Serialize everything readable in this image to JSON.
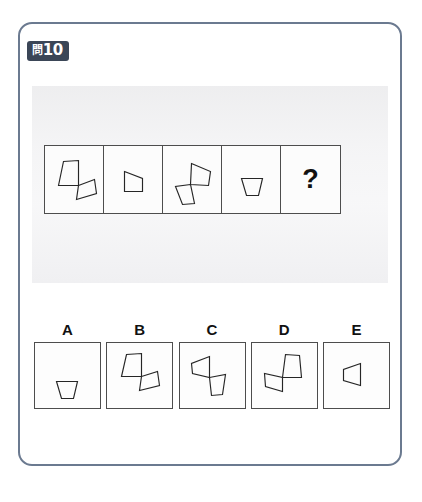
{
  "card": {
    "badge": {
      "kanji": "問",
      "number": "10",
      "full_text": "問10",
      "bg_color": "#3b4657",
      "text_color": "#ffffff"
    },
    "border_color": "#6b7a90",
    "background_color": "#ffffff"
  },
  "sequence": {
    "cells": [
      {
        "id": "seq-1",
        "content": "up-trapezoid-plus-right-trapezoid",
        "is_answer_slot": false
      },
      {
        "id": "seq-2",
        "content": "right-trapezoid",
        "is_answer_slot": false
      },
      {
        "id": "seq-3",
        "content": "right-trapezoid-plus-down-trapezoid",
        "is_answer_slot": false
      },
      {
        "id": "seq-4",
        "content": "down-trapezoid",
        "is_answer_slot": false
      },
      {
        "id": "seq-5",
        "content": "question-mark",
        "is_answer_slot": true,
        "label": "?"
      }
    ]
  },
  "options": [
    {
      "label": "A",
      "content": "down-trapezoid"
    },
    {
      "label": "B",
      "content": "up-trapezoid-plus-right-trapezoid"
    },
    {
      "label": "C",
      "content": "left-trapezoid-plus-down-trapezoid"
    },
    {
      "label": "D",
      "content": "up-trapezoid-plus-left-trapezoid"
    },
    {
      "label": "E",
      "content": "left-trapezoid"
    }
  ],
  "colors": {
    "shape_stroke": "#262626",
    "cell_border": "#4d4d4d",
    "scan_band": "#ececee"
  }
}
